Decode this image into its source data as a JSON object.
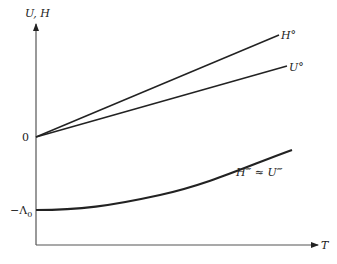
{
  "diagram": {
    "y_axis_label": "U, H",
    "x_axis_label": "T",
    "origin_label": "0",
    "lambda_label": "−Λ",
    "lambda_subscript": "0",
    "curves": [
      {
        "name": "H-degree",
        "label": "H°",
        "type": "line",
        "from": [
          0,
          0
        ],
        "slope": "steeper"
      },
      {
        "name": "U-degree",
        "label": "U°",
        "type": "line",
        "from": [
          0,
          0
        ],
        "slope": "shallower"
      },
      {
        "name": "H-triple-prime",
        "label": "H‴ ≈ U‴",
        "type": "curve",
        "starts_at": "-Λ0",
        "shape": "rising, concave up"
      }
    ],
    "colors": {
      "lines": "#222222",
      "axes": "#555555",
      "background": "#ffffff"
    }
  }
}
